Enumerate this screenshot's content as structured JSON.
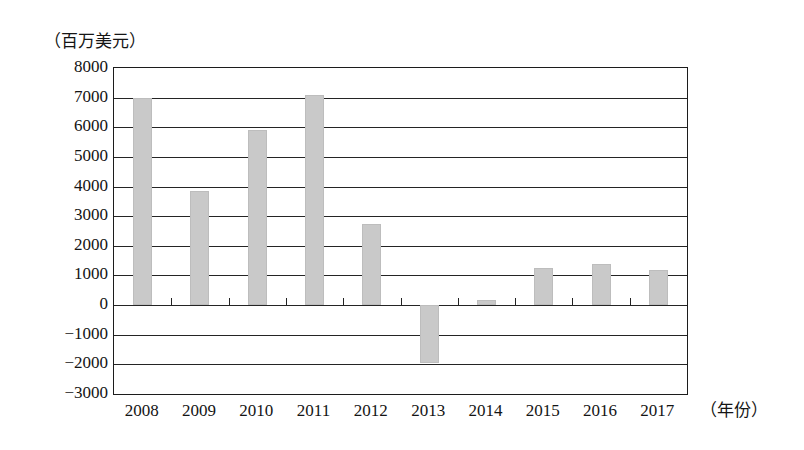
{
  "chart_data": {
    "type": "bar",
    "title": "",
    "subtitle": "",
    "ylabel": "（百万美元）",
    "xlabel": "（年份）",
    "categories": [
      "2008",
      "2009",
      "2010",
      "2011",
      "2012",
      "2013",
      "2014",
      "2015",
      "2016",
      "2017"
    ],
    "values": [
      6980,
      3850,
      5900,
      7080,
      2750,
      -1950,
      170,
      1250,
      1400,
      1200
    ],
    "series": [
      {
        "name": "金额",
        "values": [
          6980,
          3850,
          5900,
          7080,
          2750,
          -1950,
          170,
          1250,
          1400,
          1200
        ]
      }
    ],
    "ylim": [
      -3000,
      8000
    ],
    "ytick_values": [
      8000,
      7000,
      6000,
      5000,
      4000,
      3000,
      2000,
      1000,
      0,
      -1000,
      -2000,
      -3000
    ],
    "ytick_labels": [
      "8000",
      "7000",
      "6000",
      "5000",
      "4000",
      "3000",
      "2000",
      "1000",
      "0",
      "−1000",
      "−2000",
      "−3000"
    ],
    "ytick_step": 1000,
    "grid": true,
    "grid_orientation": "horizontal",
    "legend": false,
    "legend_position": "none",
    "bar_color": "#c9c9c9",
    "axis_color": "#222222",
    "background_color": "#ffffff",
    "zero_line_value": 0,
    "annotations": []
  },
  "axes": {
    "y_unit_caption": "（百万美元）",
    "x_unit_caption": "（年份）"
  }
}
